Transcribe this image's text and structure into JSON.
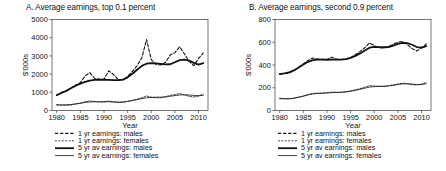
{
  "figure": {
    "background": "#ffffff",
    "axis_color": "#3a3a3a",
    "series_color": "#111111"
  },
  "chart_data": [
    {
      "type": "line",
      "panel": "A",
      "title": "A. Average earnings, top 0.1 percent",
      "xlabel": "Year",
      "ylabel": "$'000s",
      "xlim": [
        1979,
        2012
      ],
      "ylim": [
        0,
        5000
      ],
      "xticks": [
        1980,
        1985,
        1990,
        1995,
        2000,
        2005,
        2010
      ],
      "yticks": [
        0,
        1000,
        2000,
        3000,
        4000,
        5000
      ],
      "grid": false,
      "legend_position": "below-axis",
      "x": [
        1980,
        1981,
        1982,
        1983,
        1984,
        1985,
        1986,
        1987,
        1988,
        1989,
        1990,
        1991,
        1992,
        1993,
        1994,
        1995,
        1996,
        1997,
        1998,
        1999,
        2000,
        2001,
        2002,
        2003,
        2004,
        2005,
        2006,
        2007,
        2008,
        2009,
        2010,
        2011
      ],
      "series": [
        {
          "name": "1 yr earnings: males",
          "style": "dashed",
          "width": 1.1,
          "values": [
            850,
            1000,
            1060,
            1230,
            1400,
            1530,
            1900,
            2080,
            1770,
            1720,
            1720,
            2180,
            1980,
            1710,
            1680,
            1870,
            2150,
            2460,
            2900,
            3900,
            2800,
            2530,
            2500,
            2640,
            3050,
            3180,
            3500,
            3120,
            2700,
            2460,
            2860,
            3150
          ]
        },
        {
          "name": "1 yr earnings: females",
          "style": "fine-dashed",
          "width": 0.8,
          "values": [
            320,
            300,
            290,
            300,
            360,
            400,
            480,
            520,
            500,
            470,
            470,
            520,
            470,
            440,
            450,
            500,
            560,
            620,
            700,
            800,
            730,
            700,
            700,
            760,
            830,
            870,
            930,
            860,
            780,
            740,
            800,
            900
          ]
        },
        {
          "name": "5 yr av earnings: males",
          "style": "solid-thick",
          "width": 1.8,
          "values": [
            840,
            960,
            1080,
            1220,
            1360,
            1480,
            1570,
            1640,
            1680,
            1690,
            1690,
            1680,
            1670,
            1670,
            1700,
            1820,
            2020,
            2240,
            2450,
            2570,
            2600,
            2590,
            2560,
            2530,
            2540,
            2650,
            2770,
            2800,
            2740,
            2620,
            2520,
            2600
          ]
        },
        {
          "name": "5 yr av earnings: females",
          "style": "solid-thin",
          "width": 0.8,
          "values": [
            300,
            300,
            310,
            330,
            360,
            400,
            440,
            470,
            480,
            480,
            480,
            480,
            470,
            465,
            470,
            500,
            545,
            600,
            650,
            700,
            720,
            730,
            735,
            745,
            780,
            820,
            855,
            865,
            850,
            830,
            810,
            830
          ]
        }
      ]
    },
    {
      "type": "line",
      "panel": "B",
      "title": "B. Average earnings, second 0.9 percent",
      "xlabel": "Year",
      "ylabel": "$'000s",
      "xlim": [
        1979,
        2012
      ],
      "ylim": [
        0,
        800
      ],
      "xticks": [
        1980,
        1985,
        1990,
        1995,
        2000,
        2005,
        2010
      ],
      "yticks": [
        0,
        200,
        400,
        600,
        800
      ],
      "grid": false,
      "legend_position": "below-axis",
      "x": [
        1980,
        1981,
        1982,
        1983,
        1984,
        1985,
        1986,
        1987,
        1988,
        1989,
        1990,
        1991,
        1992,
        1993,
        1994,
        1995,
        1996,
        1997,
        1998,
        1999,
        2000,
        2001,
        2002,
        2003,
        2004,
        2005,
        2006,
        2007,
        2008,
        2009,
        2010,
        2011
      ],
      "series": [
        {
          "name": "1 yr earnings: males",
          "style": "dashed",
          "width": 1.1,
          "values": [
            322,
            325,
            330,
            350,
            380,
            410,
            440,
            462,
            452,
            450,
            448,
            468,
            452,
            448,
            450,
            465,
            490,
            520,
            552,
            595,
            570,
            552,
            550,
            562,
            582,
            600,
            608,
            578,
            545,
            522,
            552,
            585
          ]
        },
        {
          "name": "1 yr earnings: females",
          "style": "fine-dashed",
          "width": 0.8,
          "values": [
            108,
            104,
            102,
            108,
            118,
            128,
            140,
            150,
            152,
            152,
            155,
            162,
            160,
            160,
            165,
            172,
            182,
            192,
            205,
            218,
            215,
            212,
            212,
            218,
            225,
            232,
            240,
            235,
            228,
            225,
            232,
            245
          ]
        },
        {
          "name": "5 yr av earnings: males",
          "style": "solid-thick",
          "width": 1.8,
          "values": [
            320,
            326,
            336,
            352,
            378,
            405,
            428,
            442,
            448,
            448,
            446,
            448,
            448,
            448,
            452,
            462,
            480,
            502,
            528,
            552,
            560,
            558,
            556,
            558,
            570,
            585,
            595,
            592,
            578,
            558,
            552,
            565
          ]
        },
        {
          "name": "5 yr av earnings: females",
          "style": "solid-thin",
          "width": 0.8,
          "values": [
            104,
            103,
            104,
            108,
            116,
            126,
            137,
            146,
            150,
            152,
            154,
            157,
            158,
            160,
            163,
            169,
            177,
            186,
            196,
            206,
            210,
            212,
            213,
            216,
            221,
            228,
            234,
            235,
            232,
            228,
            228,
            236
          ]
        }
      ]
    }
  ],
  "legend": {
    "items": [
      {
        "label": "1 yr earnings: males",
        "style": "dashed"
      },
      {
        "label": "1 yr earnings: females",
        "style": "fine-dashed"
      },
      {
        "label": "5 yr av earnings: males",
        "style": "solid-thick"
      },
      {
        "label": "5 yr av earnings: females",
        "style": "solid-thin"
      }
    ]
  }
}
